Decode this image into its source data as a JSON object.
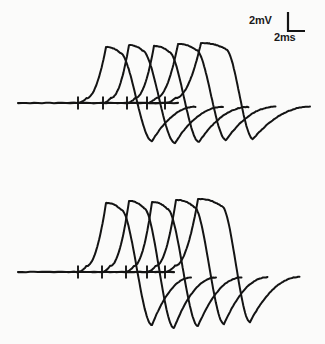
{
  "figure": {
    "background_color": "#fbfbfa",
    "trace_color": "#141414",
    "width": 325,
    "height": 344
  },
  "scalebar": {
    "name": "calibration-scale-bar",
    "vertical_label": "2mV",
    "horizontal_label": "2ms",
    "vertical_value": 2,
    "vertical_units": "mV",
    "horizontal_value": 2,
    "horizontal_units": "ms",
    "corner_x": 288,
    "corner_y": 31,
    "vertical_px": 19,
    "horizontal_px": 17
  },
  "chart_data": {
    "type": "line",
    "subtitle": "Two recording panels, five superimposed sweeps each",
    "xlabel": "Time (ms)",
    "ylabel": "Membrane potential (mV)",
    "grid": false,
    "legend": false,
    "axes_visible": false,
    "scale_bar": {
      "vertical": "2mV",
      "horizontal": "2ms"
    },
    "px_per_ms": 8.5,
    "px_per_mV": 9.5,
    "panels": [
      {
        "name": "upper-panel",
        "baseline_y": 103,
        "baseline_x_start": 18,
        "baseline_x_end": 178,
        "stimulus_marks_x": [
          78,
          103,
          127,
          147,
          165
        ],
        "stimulus_mark_count": 5,
        "series": [
          {
            "name": "sweep-1",
            "onset_x": 78,
            "peak_x": 106,
            "peak_y": 47,
            "peak_amplitude_mv": 5.9,
            "width_px": 46,
            "ahp_x": 152,
            "ahp_y": 141,
            "ahp_amplitude_mv": -4.0,
            "tail_end_x": 196,
            "crest_flatness": 0.3
          },
          {
            "name": "sweep-2",
            "onset_x": 103,
            "peak_x": 129,
            "peak_y": 45,
            "peak_amplitude_mv": 6.1,
            "width_px": 45,
            "ahp_x": 175,
            "ahp_y": 143,
            "ahp_amplitude_mv": -4.2,
            "tail_end_x": 223,
            "crest_flatness": 0.3
          },
          {
            "name": "sweep-3",
            "onset_x": 127,
            "peak_x": 154,
            "peak_y": 46,
            "peak_amplitude_mv": 6.0,
            "width_px": 46,
            "ahp_x": 199,
            "ahp_y": 142,
            "ahp_amplitude_mv": -4.1,
            "tail_end_x": 249,
            "crest_flatness": 0.32
          },
          {
            "name": "sweep-4",
            "onset_x": 147,
            "peak_x": 178,
            "peak_y": 44,
            "peak_amplitude_mv": 6.2,
            "width_px": 50,
            "ahp_x": 226,
            "ahp_y": 140,
            "ahp_amplitude_mv": -3.9,
            "tail_end_x": 276,
            "crest_flatness": 0.36
          },
          {
            "name": "sweep-5",
            "onset_x": 165,
            "peak_x": 201,
            "peak_y": 43,
            "peak_amplitude_mv": 6.3,
            "width_px": 56,
            "ahp_x": 253,
            "ahp_y": 139,
            "ahp_amplitude_mv": -3.8,
            "tail_end_x": 311,
            "crest_flatness": 0.44
          }
        ]
      },
      {
        "name": "lower-panel",
        "baseline_y": 272,
        "baseline_x_start": 18,
        "baseline_x_end": 176,
        "stimulus_marks_x": [
          78,
          102,
          126,
          147,
          165
        ],
        "stimulus_mark_count": 5,
        "series": [
          {
            "name": "sweep-1",
            "onset_x": 78,
            "peak_x": 106,
            "peak_y": 203,
            "peak_amplitude_mv": 7.3,
            "width_px": 45,
            "ahp_x": 152,
            "ahp_y": 325,
            "ahp_amplitude_mv": -5.6,
            "tail_end_x": 192,
            "crest_flatness": 0.34
          },
          {
            "name": "sweep-2",
            "onset_x": 102,
            "peak_x": 129,
            "peak_y": 201,
            "peak_amplitude_mv": 7.5,
            "width_px": 44,
            "ahp_x": 174,
            "ahp_y": 328,
            "ahp_amplitude_mv": -5.9,
            "tail_end_x": 216,
            "crest_flatness": 0.34
          },
          {
            "name": "sweep-3",
            "onset_x": 126,
            "peak_x": 152,
            "peak_y": 202,
            "peak_amplitude_mv": 7.4,
            "width_px": 45,
            "ahp_x": 198,
            "ahp_y": 326,
            "ahp_amplitude_mv": -5.7,
            "tail_end_x": 242,
            "crest_flatness": 0.34
          },
          {
            "name": "sweep-4",
            "onset_x": 147,
            "peak_x": 176,
            "peak_y": 200,
            "peak_amplitude_mv": 7.6,
            "width_px": 48,
            "ahp_x": 224,
            "ahp_y": 324,
            "ahp_amplitude_mv": -5.5,
            "tail_end_x": 268,
            "crest_flatness": 0.38
          },
          {
            "name": "sweep-5",
            "onset_x": 165,
            "peak_x": 198,
            "peak_y": 199,
            "peak_amplitude_mv": 7.7,
            "width_px": 54,
            "ahp_x": 250,
            "ahp_y": 322,
            "ahp_amplitude_mv": -5.4,
            "tail_end_x": 300,
            "crest_flatness": 0.44
          }
        ]
      }
    ]
  }
}
